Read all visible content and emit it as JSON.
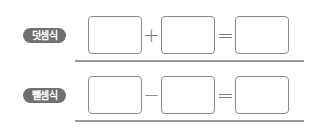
{
  "rows": [
    {
      "label": "덧셈식",
      "operator": "+",
      "equals": "=",
      "boxes": [
        "",
        "",
        ""
      ]
    },
    {
      "label": "뺄셈식",
      "operator": "−",
      "equals": "=",
      "boxes": [
        "",
        "",
        ""
      ]
    }
  ],
  "colors": {
    "badge_bg": "#6f6f6f",
    "box_border": "#8a8a8a",
    "rule": "#9a9a9a"
  }
}
